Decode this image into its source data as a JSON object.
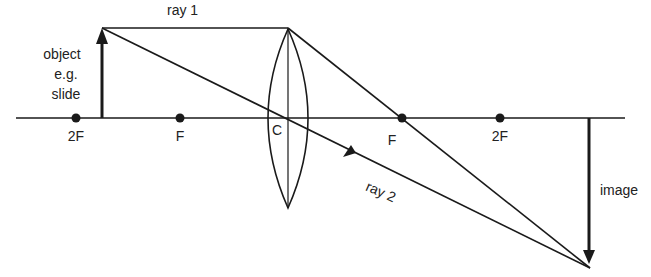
{
  "diagram": {
    "colors": {
      "line": "#1a1a1a",
      "text": "#222222",
      "background": "#ffffff"
    },
    "axis_points": [
      {
        "label": "2F",
        "x": 76
      },
      {
        "label": "F",
        "x": 180
      },
      {
        "label": "C",
        "x": 288
      },
      {
        "label": "F",
        "x": 402
      },
      {
        "label": "2F",
        "x": 500
      }
    ],
    "labels": {
      "ray1": "ray 1",
      "ray2": "ray 2",
      "object_line1": "object",
      "object_line2": "e.g.",
      "object_line3": "slide",
      "image": "image",
      "center": "C",
      "p0": "2F",
      "p1": "F",
      "p3": "F",
      "p4": "2F"
    }
  }
}
